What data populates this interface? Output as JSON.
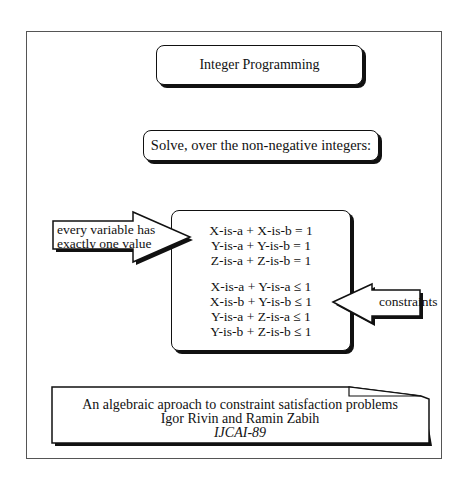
{
  "title": "Integer Programming",
  "subtitle": "Solve, over the non-negative integers:",
  "equations": {
    "equalities": [
      "X-is-a + X-is-b = 1",
      "Y-is-a + Y-is-b = 1",
      "Z-is-a + Z-is-b = 1"
    ],
    "inequalities": [
      "X-is-a + Y-is-a ≤ 1",
      "X-is-b + Y-is-b ≤ 1",
      "Y-is-a + Z-is-a ≤ 1",
      "Y-is-b + Z-is-b ≤ 1"
    ]
  },
  "annotations": {
    "left_arrow": {
      "line1": "every variable has",
      "line2": "exactly one value",
      "icon": "right-arrow-icon"
    },
    "right_arrow": {
      "label": "constraints",
      "icon": "left-arrow-icon"
    }
  },
  "reference": {
    "paper_title": "An algebraic aproach to constraint satisfaction problems",
    "authors": "Igor Rivin and Ramin Zabih",
    "venue": "IJCAI-89"
  },
  "colors": {
    "stroke": "#111111",
    "frame": "#555555",
    "background": "#ffffff"
  }
}
